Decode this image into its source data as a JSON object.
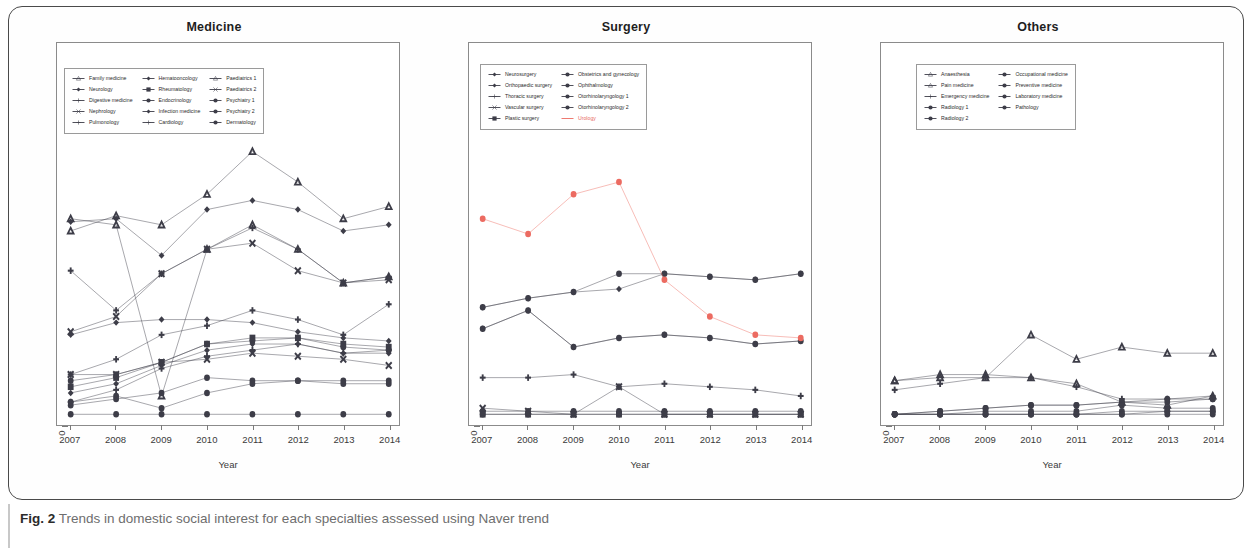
{
  "caption": {
    "prefix": "Fig. 2",
    "text": "Trends in domestic social interest for each specialties assessed using Naver trend"
  },
  "axis": {
    "x_label": "Year",
    "x_ticks": [
      "2007",
      "2008",
      "2009",
      "2010",
      "2011",
      "2012",
      "2013",
      "2014"
    ],
    "y_ticks": [
      "0",
      "20",
      "40",
      "60",
      "80",
      "100",
      "120"
    ],
    "y_min": 0,
    "y_max": 120
  },
  "colors": {
    "line_default": "#3d3d48",
    "line_accent": "#ec6b61",
    "frame": "#4a4a4a",
    "axis": "#8b8b8b",
    "text": "#2c2c2c",
    "caption_text": "#6e6e6e"
  },
  "chart_data": [
    {
      "type": "line",
      "title": "Medicine",
      "xlabel": "Year",
      "ylabel": "",
      "x": [
        "2007",
        "2008",
        "2009",
        "2010",
        "2011",
        "2012",
        "2013",
        "2014"
      ],
      "ylim": [
        0,
        120
      ],
      "grid": false,
      "legend_position": "top-left-inside",
      "series": [
        {
          "name": "Family medicine",
          "values": [
            61,
            66,
            63,
            73,
            87,
            77,
            65,
            69
          ],
          "color": "#3d3d48",
          "marker": "triangle"
        },
        {
          "name": "Neurology",
          "values": [
            64,
            65,
            53,
            68,
            71,
            68,
            61,
            63
          ],
          "color": "#3d3d48",
          "marker": "diamond"
        },
        {
          "name": "Digestive medicine",
          "values": [
            48,
            35,
            47,
            55,
            62,
            55,
            44,
            46
          ],
          "color": "#3d3d48",
          "marker": "plus"
        },
        {
          "name": "Nephrology",
          "values": [
            28,
            33,
            47,
            55,
            57,
            48,
            44,
            45
          ],
          "color": "#3d3d48",
          "marker": "cross"
        },
        {
          "name": "Pulmonology",
          "values": [
            14,
            19,
            27,
            30,
            35,
            32,
            27,
            37
          ],
          "color": "#3d3d48",
          "marker": "plus"
        },
        {
          "name": "Hematooncology",
          "values": [
            27,
            31,
            32,
            32,
            31,
            28,
            26,
            25
          ],
          "color": "#3d3d48",
          "marker": "diamond"
        },
        {
          "name": "Rheumatology",
          "values": [
            10,
            13,
            18,
            24,
            26,
            26,
            24,
            23
          ],
          "color": "#3d3d48",
          "marker": "square"
        },
        {
          "name": "Endocrinology",
          "values": [
            12,
            14,
            18,
            24,
            25,
            26,
            23,
            22
          ],
          "color": "#3d3d48",
          "marker": "circle"
        },
        {
          "name": "Infection medicine",
          "values": [
            8,
            11,
            17,
            22,
            24,
            24,
            21,
            21
          ],
          "color": "#3d3d48",
          "marker": "diamond"
        },
        {
          "name": "Cardiology",
          "values": [
            5,
            9,
            16,
            20,
            22,
            24,
            21,
            22
          ],
          "color": "#3d3d48",
          "marker": "plus"
        },
        {
          "name": "Paediatrics 1",
          "values": [
            65,
            63,
            7,
            55,
            63,
            55,
            44,
            46
          ],
          "color": "#3d3d48",
          "marker": "triangle"
        },
        {
          "name": "Paediatrics 2",
          "values": [
            14,
            14,
            18,
            19,
            21,
            20,
            19,
            17
          ],
          "color": "#3d3d48",
          "marker": "cross"
        },
        {
          "name": "Psychiatry 1",
          "values": [
            4,
            6,
            8,
            13,
            12,
            12,
            12,
            12
          ],
          "color": "#3d3d48",
          "marker": "circle"
        },
        {
          "name": "Psychiatry 2",
          "values": [
            5,
            7,
            3,
            8,
            11,
            12,
            11,
            11
          ],
          "color": "#3d3d48",
          "marker": "circle"
        },
        {
          "name": "Dermatology",
          "values": [
            1,
            1,
            1,
            1,
            1,
            1,
            1,
            1
          ],
          "color": "#3d3d48",
          "marker": "circle"
        }
      ]
    },
    {
      "type": "line",
      "title": "Surgery",
      "xlabel": "Year",
      "ylabel": "",
      "x": [
        "2007",
        "2008",
        "2009",
        "2010",
        "2011",
        "2012",
        "2013",
        "2014"
      ],
      "ylim": [
        0,
        120
      ],
      "grid": false,
      "legend_position": "top-left-inside",
      "series": [
        {
          "name": "Neurosurgery",
          "values": [
            36,
            39,
            41,
            42,
            47,
            46,
            45,
            47
          ],
          "color": "#3d3d48",
          "marker": "diamond"
        },
        {
          "name": "Orthopaedic surgery",
          "values": [
            29,
            35,
            23,
            26,
            27,
            26,
            24,
            25
          ],
          "color": "#3d3d48",
          "marker": "diamond"
        },
        {
          "name": "Thoracic surgery",
          "values": [
            13,
            13,
            14,
            10,
            11,
            10,
            9,
            7
          ],
          "color": "#3d3d48",
          "marker": "plus"
        },
        {
          "name": "Vascular surgery",
          "values": [
            3,
            2,
            1,
            10,
            1,
            1,
            1,
            1
          ],
          "color": "#3d3d48",
          "marker": "cross"
        },
        {
          "name": "Plastic surgery",
          "values": [
            1,
            1,
            1,
            1,
            1,
            1,
            1,
            1
          ],
          "color": "#3d3d48",
          "marker": "square"
        },
        {
          "name": "Obstetrics and gynecology",
          "values": [
            36,
            39,
            41,
            47,
            47,
            46,
            45,
            47
          ],
          "color": "#3d3d48",
          "marker": "circle"
        },
        {
          "name": "Ophthalmology",
          "values": [
            29,
            35,
            23,
            26,
            27,
            26,
            24,
            25
          ],
          "color": "#3d3d48",
          "marker": "circle"
        },
        {
          "name": "Otorhinolaryngology 1",
          "values": [
            2,
            2,
            2,
            2,
            2,
            2,
            2,
            2
          ],
          "color": "#3d3d48",
          "marker": "circle"
        },
        {
          "name": "Otorhinolaryngology 2",
          "values": [
            1,
            1,
            1,
            1,
            1,
            1,
            1,
            1
          ],
          "color": "#3d3d48",
          "marker": "circle"
        },
        {
          "name": "Urology",
          "values": [
            65,
            60,
            73,
            77,
            45,
            33,
            27,
            26
          ],
          "color": "#ec6b61",
          "marker": "circle"
        }
      ]
    },
    {
      "type": "line",
      "title": "Others",
      "xlabel": "Year",
      "ylabel": "",
      "x": [
        "2007",
        "2008",
        "2009",
        "2010",
        "2011",
        "2012",
        "2013",
        "2014"
      ],
      "ylim": [
        0,
        120
      ],
      "grid": false,
      "legend_position": "top-center-inside",
      "series": [
        {
          "name": "Anaesthesia",
          "values": [
            12,
            13,
            13,
            27,
            19,
            23,
            21,
            21
          ],
          "color": "#3d3d48",
          "marker": "triangle"
        },
        {
          "name": "Pain medicine",
          "values": [
            12,
            14,
            14,
            13,
            11,
            5,
            4,
            7
          ],
          "color": "#3d3d48",
          "marker": "triangle"
        },
        {
          "name": "Emergency medicine",
          "values": [
            9,
            11,
            13,
            13,
            10,
            6,
            6,
            7
          ],
          "color": "#3d3d48",
          "marker": "plus"
        },
        {
          "name": "Radiology 1",
          "values": [
            1,
            2,
            3,
            4,
            4,
            5,
            6,
            6
          ],
          "color": "#3d3d48",
          "marker": "circle"
        },
        {
          "name": "Radiology 2",
          "values": [
            1,
            2,
            3,
            4,
            4,
            5,
            5,
            6
          ],
          "color": "#3d3d48",
          "marker": "circle"
        },
        {
          "name": "Occupational medicine",
          "values": [
            1,
            1,
            2,
            2,
            2,
            4,
            3,
            3
          ],
          "color": "#3d3d48",
          "marker": "circle"
        },
        {
          "name": "Preventive medicine",
          "values": [
            1,
            1,
            1,
            1,
            1,
            2,
            2,
            2
          ],
          "color": "#3d3d48",
          "marker": "circle"
        },
        {
          "name": "Laboratory medicine",
          "values": [
            1,
            1,
            1,
            1,
            1,
            1,
            2,
            2
          ],
          "color": "#3d3d48",
          "marker": "circle"
        },
        {
          "name": "Pathology",
          "values": [
            1,
            1,
            1,
            1,
            1,
            1,
            1,
            1
          ],
          "color": "#3d3d48",
          "marker": "circle"
        }
      ]
    }
  ],
  "legends": [
    {
      "panel": "Medicine",
      "columns": [
        [
          "Family medicine",
          "Neurology",
          "Digestive medicine",
          "Nephrology",
          "Pulmonology"
        ],
        [
          "Hematooncology",
          "Rheumatology",
          "Endocrinology",
          "Infection medicine",
          "Cardiology"
        ],
        [
          "Paediatrics 1",
          "Paediatrics 2",
          "Psychiatry 1",
          "Psychiatry 2",
          "Dermatology"
        ]
      ]
    },
    {
      "panel": "Surgery",
      "columns": [
        [
          "Neurosurgery",
          "Orthopaedic surgery",
          "Thoracic surgery",
          "Vascular surgery",
          "Plastic surgery"
        ],
        [
          "Obstetrics and gynecology",
          "Ophthalmology",
          "Otorhinolaryngology 1",
          "Otorhinolaryngology 2",
          "Urology"
        ]
      ]
    },
    {
      "panel": "Others",
      "columns": [
        [
          "Anaesthesia",
          "Pain medicine",
          "Emergency medicine",
          "Radiology 1",
          "Radiology 2"
        ],
        [
          "Occupational medicine",
          "Preventive medicine",
          "Laboratory medicine",
          "Pathology"
        ]
      ]
    }
  ]
}
